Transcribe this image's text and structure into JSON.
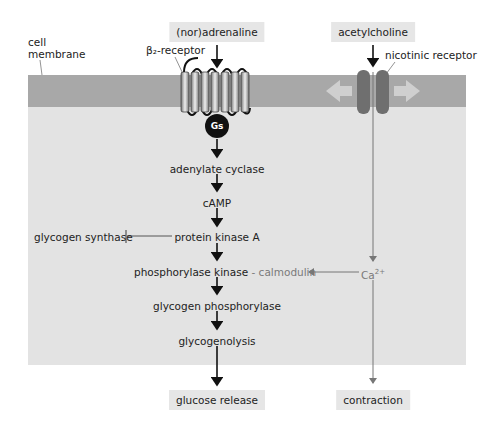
{
  "labels": {
    "cell_membrane": [
      "cell",
      "membrane"
    ],
    "beta2_receptor": "β₂-receptor",
    "nicotinic_receptor": "nicotinic receptor",
    "gs": "Gs"
  },
  "inputs": {
    "noradrenaline": "(nor)adrenaline",
    "acetylcholine": "acetylcholine"
  },
  "pathway": {
    "steps": [
      "adenylate cyclase",
      "cAMP",
      "protein kinase A",
      "phosphorylase kinase",
      "glycogen phosphorylase",
      "glycogenolysis"
    ],
    "calmodulin_sep": " - ",
    "calmodulin": "calmodulin",
    "inhibited": "glycogen synthase",
    "calcium": "Ca",
    "calcium_sup": "2+"
  },
  "outputs": {
    "glucose_release": "glucose release",
    "contraction": "contraction"
  },
  "colors": {
    "membrane": "#a8a8a8",
    "cytoplasm": "#e3e3e3",
    "label_box": "#e6e6e6",
    "channel": "#6f6f6f",
    "gs": "#111111"
  }
}
